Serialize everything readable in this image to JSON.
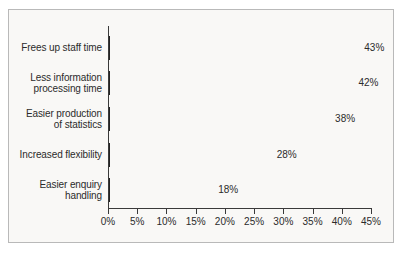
{
  "chart_data": {
    "type": "bar",
    "orientation": "horizontal",
    "title": "",
    "xlabel": "",
    "ylabel": "",
    "categories": [
      "Frees up staff time",
      "Less information\nprocessing time",
      "Easier production\nof statistics",
      "Increased flexibility",
      "Easier enquiry\nhandling"
    ],
    "values": [
      43,
      42,
      38,
      28,
      18
    ],
    "data_labels": [
      "43%",
      "42%",
      "38%",
      "28%",
      "18%"
    ],
    "xlim": [
      0,
      45
    ],
    "xtick_values": [
      0,
      5,
      10,
      15,
      20,
      25,
      30,
      35,
      40,
      45
    ],
    "xtick_labels": [
      "0%",
      "5%",
      "10%",
      "15%",
      "20%",
      "25%",
      "30%",
      "35%",
      "40%",
      "45%"
    ],
    "grid": false,
    "legend": null,
    "colors": {
      "bar_fill": "#c9c9c9",
      "bar_border": "#232323",
      "axis": "#3a3a3a",
      "text": "#2b2b2b",
      "background": "#f9f8f6",
      "frame_border": "#b9b9b9"
    }
  }
}
